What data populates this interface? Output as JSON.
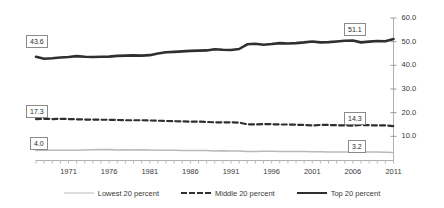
{
  "chart_data": {
    "type": "line",
    "title": "",
    "subtitle": "",
    "xlabel": "",
    "ylabel": "",
    "xlim": [
      1967,
      2011
    ],
    "ylim": [
      0.0,
      60.0
    ],
    "grid": false,
    "legend_position": "bottom-center",
    "y_ticks": [
      "60.0",
      "50.0",
      "40.0",
      "30.0",
      "20.0",
      "10.0"
    ],
    "y_tick_values": [
      60.0,
      50.0,
      40.0,
      30.0,
      20.0,
      10.0
    ],
    "x_ticks": [
      "1971",
      "1976",
      "1981",
      "1986",
      "1991",
      "1996",
      "2001",
      "2006",
      "2011"
    ],
    "x_tick_values": [
      1971,
      1976,
      1981,
      1986,
      1991,
      1996,
      2001,
      2006,
      2011
    ],
    "x": [
      1967,
      1968,
      1969,
      1970,
      1971,
      1972,
      1973,
      1974,
      1975,
      1976,
      1977,
      1978,
      1979,
      1980,
      1981,
      1982,
      1983,
      1984,
      1985,
      1986,
      1987,
      1988,
      1989,
      1990,
      1991,
      1992,
      1993,
      1994,
      1995,
      1996,
      1997,
      1998,
      1999,
      2000,
      2001,
      2002,
      2003,
      2004,
      2005,
      2006,
      2007,
      2008,
      2009,
      2010,
      2011
    ],
    "series": [
      {
        "name": "Top 20 percent",
        "style": "solid",
        "color": "#2f2f2f",
        "width": 2.6,
        "start_label": "43.6",
        "end_label": "51.1",
        "start_value": 43.6,
        "end_value": 51.1,
        "values": [
          43.6,
          42.8,
          43.0,
          43.3,
          43.5,
          43.9,
          43.6,
          43.5,
          43.6,
          43.7,
          44.0,
          44.1,
          44.2,
          44.1,
          44.3,
          45.0,
          45.5,
          45.7,
          45.9,
          46.1,
          46.2,
          46.3,
          46.8,
          46.6,
          46.5,
          46.9,
          48.9,
          49.1,
          48.7,
          49.0,
          49.4,
          49.2,
          49.4,
          49.7,
          50.1,
          49.7,
          49.8,
          50.1,
          50.4,
          50.5,
          49.7,
          50.0,
          50.3,
          50.2,
          51.1
        ]
      },
      {
        "name": "Middle 20 percent",
        "style": "dashed",
        "color": "#2f2f2f",
        "width": 2.2,
        "start_label": "17.3",
        "end_label": "14.3",
        "start_value": 17.3,
        "end_value": 14.3,
        "values": [
          17.3,
          17.4,
          17.3,
          17.4,
          17.3,
          17.2,
          17.1,
          17.1,
          17.0,
          17.0,
          16.9,
          16.8,
          16.8,
          16.8,
          16.7,
          16.6,
          16.5,
          16.4,
          16.3,
          16.2,
          16.2,
          16.1,
          15.9,
          15.9,
          15.9,
          15.8,
          15.1,
          15.0,
          15.2,
          15.1,
          15.0,
          15.0,
          14.9,
          14.8,
          14.6,
          14.8,
          14.8,
          14.7,
          14.6,
          14.5,
          14.8,
          14.7,
          14.6,
          14.6,
          14.3
        ]
      },
      {
        "name": "Lowest 20 percent",
        "style": "solid",
        "color": "#b9b9b9",
        "width": 1.6,
        "start_label": "4.0",
        "end_label": "3.2",
        "start_value": 4.0,
        "end_value": 3.2,
        "values": [
          4.0,
          4.2,
          4.1,
          4.1,
          4.1,
          4.1,
          4.2,
          4.3,
          4.4,
          4.4,
          4.2,
          4.3,
          4.2,
          4.3,
          4.2,
          4.1,
          4.1,
          4.1,
          4.0,
          4.0,
          4.0,
          4.0,
          3.8,
          3.9,
          3.8,
          3.8,
          3.6,
          3.6,
          3.7,
          3.7,
          3.6,
          3.6,
          3.6,
          3.6,
          3.5,
          3.5,
          3.4,
          3.4,
          3.4,
          3.4,
          3.4,
          3.4,
          3.4,
          3.3,
          3.2
        ]
      }
    ],
    "legend": [
      "Lowest 20 percent",
      "Middle 20 percent",
      "Top 20 percent"
    ]
  }
}
